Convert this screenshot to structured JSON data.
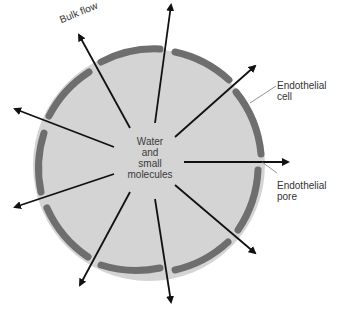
{
  "diagram": {
    "center_label": [
      "Water",
      "and",
      "small",
      "molecules"
    ],
    "labels": {
      "bulk_flow": "Bulk flow",
      "endothelial_cell": [
        "Endothelial",
        "cell"
      ],
      "endothelial_pore": [
        "Endothelial",
        "pore"
      ]
    },
    "colors": {
      "lumen_fill": "#d4d4d4",
      "membrane": "#6e6e6e",
      "arrow": "#111111",
      "leader_line": "#777777",
      "text": "#333333"
    },
    "circle": {
      "cx": 149,
      "cy": 165,
      "r": 118
    },
    "membrane_segments": 10,
    "arrows": [
      {
        "name": "bulk-flow",
        "from": [
          130,
          128
        ],
        "to": [
          77,
          31
        ]
      },
      {
        "name": "top",
        "from": [
          155,
          123
        ],
        "to": [
          172,
          2
        ]
      },
      {
        "name": "upper-left",
        "from": [
          114,
          147
        ],
        "to": [
          12,
          108
        ]
      },
      {
        "name": "upper-right",
        "from": [
          175,
          137
        ],
        "to": [
          258,
          64
        ]
      },
      {
        "name": "right",
        "from": [
          184,
          162
        ],
        "to": [
          291,
          162
        ]
      },
      {
        "name": "left-lower",
        "from": [
          114,
          174
        ],
        "to": [
          12,
          208
        ]
      },
      {
        "name": "lower-left",
        "from": [
          130,
          192
        ],
        "to": [
          78,
          288
        ]
      },
      {
        "name": "bottom",
        "from": [
          155,
          199
        ],
        "to": [
          172,
          305
        ]
      },
      {
        "name": "lower-right",
        "from": [
          175,
          185
        ],
        "to": [
          258,
          255
        ]
      }
    ]
  }
}
